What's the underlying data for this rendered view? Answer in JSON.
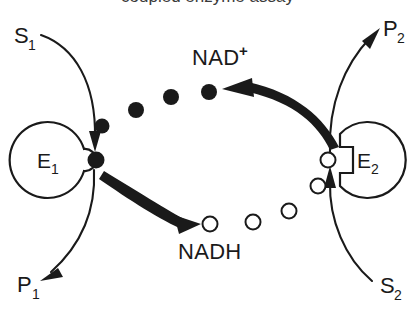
{
  "figure": {
    "kind": "biochemical-coenzyme-cycling-diagram",
    "clipped_title": "coupled enzyme assay",
    "background_color": "#ffffff",
    "ink_color": "#1a1a1a"
  },
  "enzymes": [
    {
      "id": "E1",
      "label": "E",
      "subscript": "1",
      "notch_shape": "rounded",
      "notch_side": "right",
      "occupied_by": "filled-dot"
    },
    {
      "id": "E2",
      "label": "E",
      "subscript": "2",
      "notch_shape": "square",
      "notch_side": "left",
      "occupied_by": "open-circle"
    }
  ],
  "substrates": [
    {
      "id": "S1",
      "label": "S",
      "subscript": "1",
      "position": "top-left",
      "role": "substrate"
    },
    {
      "id": "P1",
      "label": "P",
      "subscript": "1",
      "position": "bottom-left",
      "role": "product"
    },
    {
      "id": "P2",
      "label": "P",
      "subscript": "2",
      "position": "top-right",
      "role": "product"
    },
    {
      "id": "S2",
      "label": "S",
      "subscript": "2",
      "position": "bottom-right",
      "role": "substrate"
    }
  ],
  "coenzymes": [
    {
      "id": "NADplus",
      "label": "NAD",
      "superscript": "+",
      "marker": "filled-dot",
      "position": "top-center",
      "count_visible": 5
    },
    {
      "id": "NADH",
      "label": "NADH",
      "superscript": "",
      "marker": "open-circle",
      "position": "bottom-center",
      "count_visible": 5
    }
  ],
  "markers": {
    "filled_dots": [
      {
        "cx": 96,
        "cy": 160,
        "r": 8.5
      },
      {
        "cx": 102,
        "cy": 126,
        "r": 7.5
      },
      {
        "cx": 136,
        "cy": 110,
        "r": 8.0
      },
      {
        "cx": 171,
        "cy": 97,
        "r": 8.0
      },
      {
        "cx": 209,
        "cy": 92,
        "r": 8.0
      }
    ],
    "open_circles": [
      {
        "cx": 210,
        "cy": 224,
        "r": 7.5
      },
      {
        "cx": 253,
        "cy": 222,
        "r": 7.5
      },
      {
        "cx": 289,
        "cy": 211,
        "r": 7.5
      },
      {
        "cx": 318,
        "cy": 186,
        "r": 7.5
      },
      {
        "cx": 328,
        "cy": 160,
        "r": 7.5
      }
    ]
  },
  "arrows": [
    {
      "id": "s1-to-e1",
      "from": "S1",
      "to": "E1",
      "style": "thin",
      "direction": "down-right"
    },
    {
      "id": "e1-to-p1",
      "from": "E1",
      "to": "P1",
      "style": "thin",
      "direction": "down-left"
    },
    {
      "id": "e2-to-p2",
      "from": "E2",
      "to": "P2",
      "style": "thin",
      "direction": "up-right"
    },
    {
      "id": "s2-to-e2",
      "from": "S2",
      "to": "E2",
      "style": "thin",
      "direction": "up-left"
    },
    {
      "id": "e1-to-nadh",
      "from": "E1",
      "to": "NADH",
      "style": "thick",
      "direction": "down-right"
    },
    {
      "id": "e2-to-nadplus",
      "from": "E2",
      "to": "NADplus",
      "style": "thick",
      "direction": "up-left"
    }
  ]
}
